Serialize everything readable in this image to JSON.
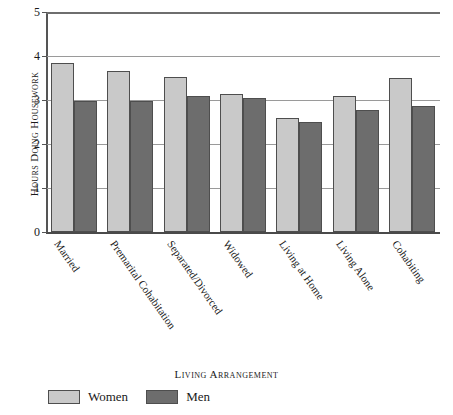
{
  "chart_data": {
    "type": "bar",
    "title": "",
    "xlabel": "Living Arrangement",
    "ylabel": "Hours Doing Housework",
    "ylim": [
      0,
      5
    ],
    "yticks": [
      0,
      1,
      2,
      3,
      4,
      5
    ],
    "ytick_labels": [
      "0",
      "1",
      "2",
      "3",
      "4",
      "5"
    ],
    "grid": "horizontal",
    "legend_position": "bottom-left",
    "categories": [
      "Married",
      "Premarital Cohabitation",
      "Separated/Divorced",
      "Widowed",
      "Living at Home",
      "Living Alone",
      "Cohabiting"
    ],
    "series": [
      {
        "name": "Women",
        "color": "#c9c9c9",
        "values": [
          3.83,
          3.67,
          3.52,
          3.13,
          2.6,
          3.08,
          3.5
        ]
      },
      {
        "name": "Men",
        "color": "#6d6d6d",
        "values": [
          2.98,
          2.98,
          3.1,
          3.05,
          2.5,
          2.78,
          2.87
        ]
      }
    ]
  },
  "legend": {
    "items": [
      {
        "label": "Women",
        "swatch": "women"
      },
      {
        "label": "Men",
        "swatch": "men"
      }
    ]
  },
  "colors": {
    "women_bar": "#c9c9c9",
    "men_bar": "#6d6d6d",
    "bar_border": "#4e4e4e",
    "gridline": "#9a9a9a",
    "axis": "#555555",
    "background": "#ffffff",
    "text": "#1a1a1a"
  }
}
